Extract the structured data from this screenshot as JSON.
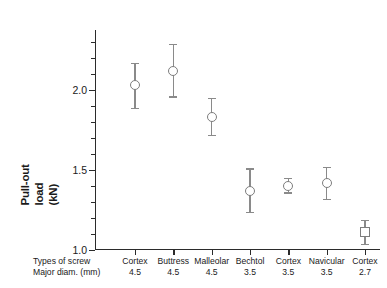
{
  "chart_data": {
    "type": "scatter",
    "title": "",
    "xlabel": "",
    "ylabel": "Pull-out load (kN)",
    "ylabel_lines": [
      "Pull-out",
      "load",
      "(kN)"
    ],
    "ylim": [
      1.0,
      2.375
    ],
    "ytick_labels": [
      "2.0",
      "1.5",
      "1.0"
    ],
    "ytick_values": [
      2.0,
      1.5,
      1.0
    ],
    "ytick_minor_step": 0.1,
    "grid": false,
    "legend": "none",
    "row_labels": [
      "Types of screw",
      "Major diam. (mm)"
    ],
    "categories": [
      "Cortex",
      "Buttress",
      "Malleolar",
      "Bechtol",
      "Cortex",
      "Navicular",
      "Cortex"
    ],
    "major_diameters": [
      "4.5",
      "4.5",
      "4.5",
      "3.5",
      "3.5",
      "3.5",
      "2.7"
    ],
    "series": [
      {
        "name": "Pull-out load",
        "values": [
          2.03,
          2.12,
          1.83,
          1.37,
          1.4,
          1.42,
          1.11
        ],
        "err_low": [
          1.89,
          1.96,
          1.72,
          1.24,
          1.36,
          1.32,
          1.04
        ],
        "err_high": [
          2.17,
          2.29,
          1.95,
          1.51,
          1.45,
          1.52,
          1.19
        ],
        "markers": [
          "circle",
          "circle",
          "circle",
          "circle",
          "circle",
          "circle",
          "square"
        ]
      }
    ],
    "colors": {
      "axis": "#2b2b2b",
      "marker_stroke": "#7d7d7d",
      "marker_fill": "#ffffff",
      "error_bar": "#8a8a8a",
      "background": "#ffffff"
    }
  }
}
